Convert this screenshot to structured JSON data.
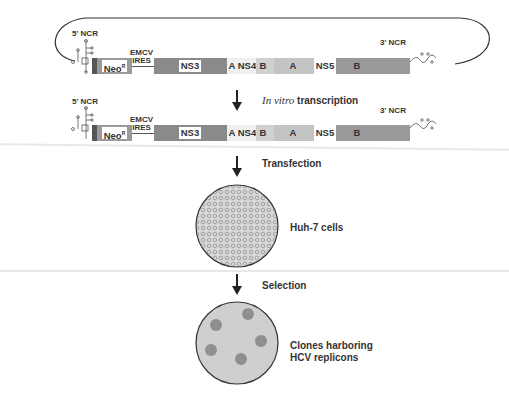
{
  "construct_top": {
    "ncr5": "5' NCR",
    "ncr3": "3' NCR",
    "emcv_line1": "EMCV",
    "emcv_line2": "IRES",
    "neo": "Neo",
    "neo_sup": "R",
    "ns3": "NS3",
    "ns4a": "A",
    "ns4": "NS4",
    "ns4b": "B",
    "ns5a": "A",
    "ns5": "NS5",
    "ns5b": "B"
  },
  "construct_bottom": {
    "ncr5": "5' NCR",
    "ncr3": "3' NCR",
    "emcv_line1": "EMCV",
    "emcv_line2": "IRES",
    "neo": "Neo",
    "neo_sup": "R",
    "ns3": "NS3",
    "ns4a": "A",
    "ns4": "NS4",
    "ns4b": "B",
    "ns5a": "A",
    "ns5": "NS5",
    "ns5b": "B"
  },
  "steps": {
    "transcription_italic": "In vitro",
    "transcription_rest": " transcription",
    "transfection": "Transfection",
    "cells_label": "Huh-7 cells",
    "selection": "Selection",
    "clones_line1": "Clones harboring",
    "clones_line2": "HCV replicons"
  },
  "colors": {
    "dark_segment": "#8a8a8a",
    "mid_segment": "#a8a8a8",
    "light_segment": "#c8c8c8",
    "circle_fill": "#cfcfcf",
    "clone_fill": "#8f8f8f"
  }
}
